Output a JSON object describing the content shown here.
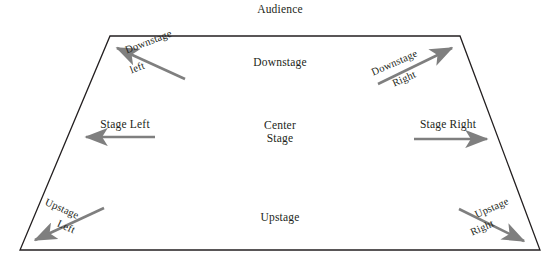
{
  "diagram": {
    "colors": {
      "outline": "#231f20",
      "arrow": "#7f7f7f",
      "text": "#231f20",
      "background": "#ffffff"
    },
    "labels": {
      "audience": "Audience",
      "downstage": "Downstage",
      "center_stage": "Center\nStage",
      "upstage": "Upstage",
      "stage_left": "Stage Left",
      "stage_right": "Stage Right"
    },
    "arrows": [
      {
        "name": "downstage-left",
        "line1": "Downstage",
        "line2": "left",
        "direction": "up-left",
        "angle_deg": -21
      },
      {
        "name": "downstage-right",
        "line1": "Downstage",
        "line2": "Right",
        "direction": "up-right",
        "angle_deg": -24
      },
      {
        "name": "stage-left",
        "line1": "Stage Left",
        "line2": "",
        "direction": "left",
        "angle_deg": 0
      },
      {
        "name": "stage-right",
        "line1": "Stage Right",
        "line2": "",
        "direction": "right",
        "angle_deg": 0
      },
      {
        "name": "upstage-left",
        "line1": "Upstage",
        "line2": "Left",
        "direction": "down-left",
        "angle_deg": 24
      },
      {
        "name": "upstage-right",
        "line1": "Upstage",
        "line2": "Right",
        "direction": "down-right",
        "angle_deg": -24
      }
    ]
  }
}
